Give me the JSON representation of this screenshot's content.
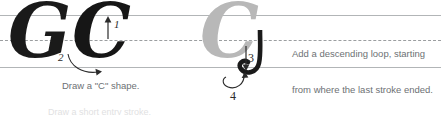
{
  "worksheet": {
    "title": "Cursive capital G stroke-order practice row",
    "letter": "G",
    "model_glyph": "G",
    "stroke_c_glyph": "C",
    "ghost_glyph": "C",
    "guide_lines": {
      "top_label": "ascender line",
      "mid_label": "x-height dashed midline",
      "base_label": "baseline"
    }
  },
  "strokes": [
    {
      "number": "1",
      "direction": "up",
      "caption": ""
    },
    {
      "number": "2",
      "direction": "curve-right",
      "caption": "Draw a \"C\" shape."
    },
    {
      "number": "3",
      "direction": "down",
      "caption": ""
    },
    {
      "number": "4",
      "direction": "curve-loop",
      "caption": ""
    }
  ],
  "captions": {
    "c_shape": "Draw a \"C\" shape.",
    "descending_loop_line1": "Add a descending loop, starting",
    "descending_loop_line2": "from where the last stroke ended.",
    "cut_off_line": "Draw a short entry stroke."
  },
  "colors": {
    "ink": "#1a1a1a",
    "ghost": "#b8b8b8",
    "rule": "#b2b5b7",
    "dashed_rule": "#9b9ea0",
    "caption_text": "#6d7174",
    "background": "#ffffff"
  }
}
